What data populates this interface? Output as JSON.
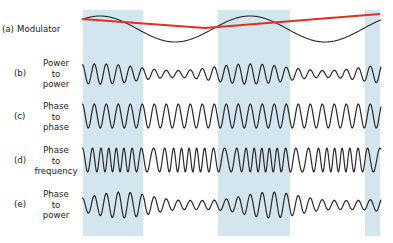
{
  "figure": {
    "plot_x_start": 82,
    "plot_x_end": 381,
    "shade_color": "#d3e6ef",
    "shade_y_top": 10,
    "shade_y_bottom": 236,
    "shaded_bands": [
      {
        "x0": 83,
        "x1": 143
      },
      {
        "x0": 218,
        "x1": 290
      },
      {
        "x0": 365,
        "x1": 380
      }
    ],
    "trace_color": "#2a2a2a",
    "envelope_color": "#e0301e"
  },
  "modulator": {
    "period_px": 150,
    "peak_x": 100,
    "envelope_points": [
      [
        82,
        19
      ],
      [
        205,
        28
      ],
      [
        380,
        14
      ]
    ]
  },
  "carrier": {
    "period_px": 12
  },
  "rows": [
    {
      "id": "a",
      "letter": "(a)",
      "name": "Modulator",
      "single_line": true,
      "center_y": 29,
      "amplitude": 13,
      "type": "modulator"
    },
    {
      "id": "b",
      "letter": "(b)",
      "name": "Power to power",
      "lines": [
        "Power",
        "to",
        "power"
      ],
      "center_y": 74,
      "amplitude": 11,
      "type": "power-to-power"
    },
    {
      "id": "c",
      "letter": "(c)",
      "name": "Phase to phase",
      "lines": [
        "Phase",
        "to",
        "phase"
      ],
      "center_y": 116,
      "amplitude": 12,
      "type": "phase-to-phase"
    },
    {
      "id": "d",
      "letter": "(d)",
      "name": "Phase to frequency",
      "lines": [
        "Phase",
        "to",
        "frequency"
      ],
      "center_y": 160,
      "amplitude": 12,
      "type": "phase-to-frequency"
    },
    {
      "id": "e",
      "letter": "(e)",
      "name": "Phase to power",
      "lines": [
        "Phase",
        "to",
        "power"
      ],
      "center_y": 205,
      "amplitude": 13,
      "type": "phase-to-power"
    }
  ]
}
